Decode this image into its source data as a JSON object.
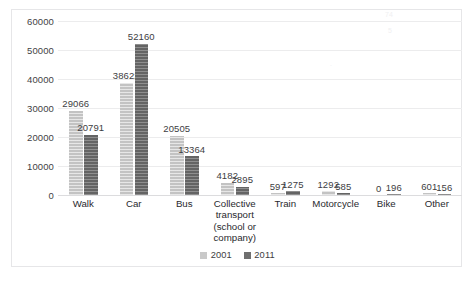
{
  "chart_data": {
    "type": "bar",
    "title": "",
    "subtitle": "",
    "xlabel": "",
    "ylabel": "",
    "ylim": [
      0,
      60000
    ],
    "ytick_step": 10000,
    "yticks": [
      "0",
      "10000",
      "20000",
      "30000",
      "40000",
      "50000",
      "60000"
    ],
    "grid": true,
    "legend_position": "bottom",
    "categories": [
      "Walk",
      "Car",
      "Bus",
      "Collective transport (school or company)",
      "Train",
      "Motorcycle",
      "Bike",
      "Other"
    ],
    "category_lines": [
      [
        "Walk"
      ],
      [
        "Car"
      ],
      [
        "Bus"
      ],
      [
        "Collective",
        "transport",
        "(school or",
        "company)"
      ],
      [
        "Train"
      ],
      [
        "Motorcycle"
      ],
      [
        "Bike"
      ],
      [
        "Other"
      ]
    ],
    "series": [
      {
        "name": "2001",
        "color": "#c9c9c9",
        "values": [
          29066,
          38622,
          20505,
          4182,
          597,
          1292,
          0,
          601
        ],
        "labels": [
          "29066",
          "38622",
          "20505",
          "4182",
          "597",
          "1292",
          "0",
          "601"
        ]
      },
      {
        "name": "2011",
        "color": "#6f6f6f",
        "values": [
          20791,
          52160,
          13364,
          2895,
          1275,
          585,
          196,
          156
        ],
        "labels": [
          "20791",
          "52160",
          "13364",
          "2895",
          "1275",
          "585",
          "196",
          "156"
        ]
      }
    ]
  },
  "legend": {
    "items": [
      {
        "label": "2001",
        "color": "#c9c9c9"
      },
      {
        "label": "2011",
        "color": "#6f6f6f"
      }
    ]
  },
  "caption": {
    "text": ""
  }
}
